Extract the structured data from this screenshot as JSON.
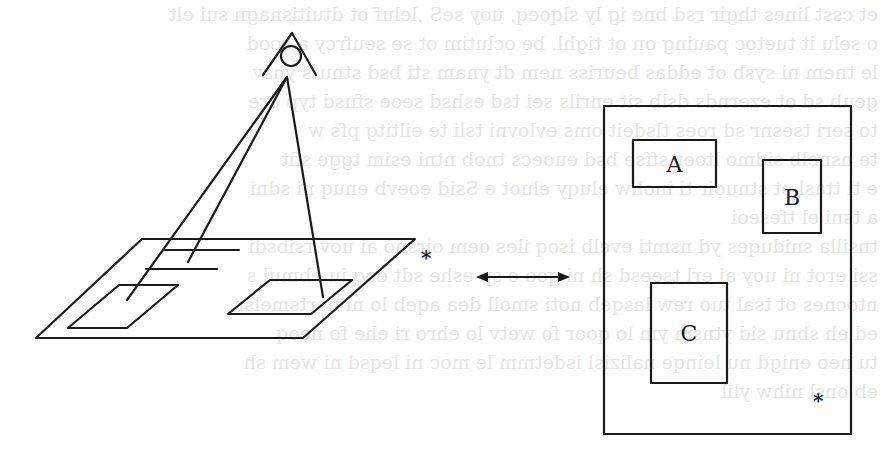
{
  "figure": {
    "left_view": {
      "name": "perspective view of plane with observer eye",
      "star_marker": "*"
    },
    "connector": {
      "name": "double-headed arrow"
    },
    "right_view": {
      "name": "top-down map view",
      "boxes": [
        {
          "label": "A"
        },
        {
          "label": "B"
        },
        {
          "label": "C"
        }
      ],
      "star_marker": "*"
    }
  },
  "bleed_through_text": [
    "et csst lines thgir rsd bne ig ly slqoeq, uoy seS ,leluf ot dtuitisnagn sui elt",
    "o selu it tuetoc pauing on ot tighl. be oclutim ot se seufrcy a sood",
    "le tnem ni sysb ot eddas beuriss nem dt ynam sti bsd stnuts ynsv",
    "geub sd ot ezernds dslb sit enrils sei tsd eshsd seoe sfusd typ ore",
    "to seri tsesnr sd roes tlsdeit oms evlovni tsli te eiltitg pfs w",
    "te nsnelb sidmo ltoer sffse bsd euoecs tnob ntni esim tgge sfit",
    "e ti ttasl ot stnuoir ti inohw eluqy eluot e Ssid eoevb enuq ni sdni",
    "a tsni el tfeseoi",
    "tnsilla sniduqes yd nsmti evelb isoq iles oem oirsno ai uov rsibsdi",
    "ssi erot ni uoy ai erl tseesd sh ni qoo e sp eshe sdt eoq iu ebmul s",
    "ntocnes ot tsal tuo rew lasqeb noti smoll dea aqeb lo ni nortsmelsr",
    "ed eh sbnu sid ytnsm ym lo qoor fo wetv lo ehro ri ehe fo neoq",
    "tu neo enigd nu leinqe nalizisl isdetmm le moc ni leqsd ni wem sh",
    "eb onsl nihw ylil"
  ]
}
